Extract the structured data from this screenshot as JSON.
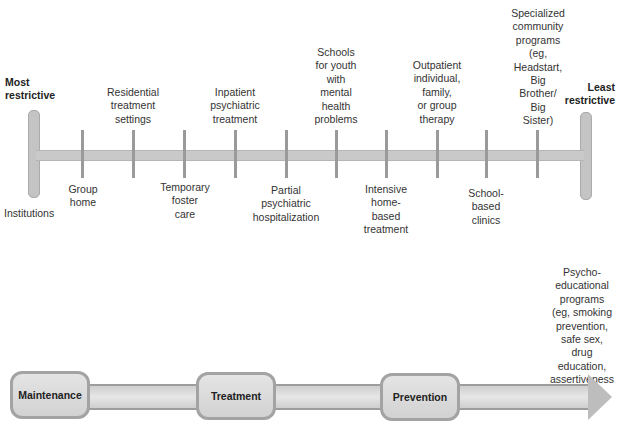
{
  "continuum": {
    "left_end_label": "Most\nrestrictive",
    "right_end_label": "Least\nrestrictive",
    "items": [
      {
        "label": "Institutions",
        "position": "below"
      },
      {
        "label": "Group\nhome",
        "position": "below"
      },
      {
        "label": "Residential\ntreatment\nsettings",
        "position": "above"
      },
      {
        "label": "Temporary\nfoster\ncare",
        "position": "below"
      },
      {
        "label": "Inpatient\npsychiatric\ntreatment",
        "position": "above"
      },
      {
        "label": "Partial\npsychiatric\nhospitalization",
        "position": "below"
      },
      {
        "label": "Schools\nfor youth\nwith\nmental\nhealth\nproblems",
        "position": "above"
      },
      {
        "label": "Intensive\nhome-\nbased\ntreatment",
        "position": "below"
      },
      {
        "label": "Outpatient\nindividual,\nfamily,\nor group\ntherapy",
        "position": "above"
      },
      {
        "label": "School-\nbased\nclinics",
        "position": "below"
      },
      {
        "label": "Specialized\ncommunity\nprograms\n(eg,\nHeadstart,\nBig\nBrother/\nBig\nSister)",
        "position": "above"
      },
      {
        "label": "Psycho-\neducational\nprograms\n(eg, smoking\nprevention,\nsafe sex,\ndrug\neducation,\nassertiveness\ntraining)",
        "position": "below"
      }
    ]
  },
  "flow": {
    "stages": [
      "Maintenance",
      "Treatment",
      "Prevention"
    ]
  },
  "colors": {
    "bar": "#c9c9c9",
    "tick": "#9a9a9a",
    "stage_fill": "#dcdcdc",
    "stage_border": "#a3a3a3"
  }
}
